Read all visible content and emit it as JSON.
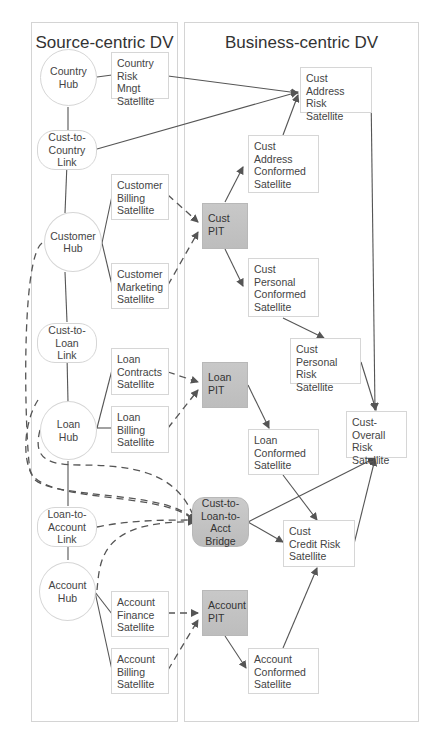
{
  "panels": {
    "left_title": "Source-centric DV",
    "right_title": "Business-centric DV"
  },
  "nodes": {
    "country_hub": "Country\nHub",
    "country_risk_sat": "Country\nRisk Mngt\nSatellite",
    "cust_country_link": "Cust-to-\nCountry\nLink",
    "customer_billing_sat": "Customer\nBilling\nSatellite",
    "customer_hub": "Customer\nHub",
    "customer_marketing_sat": "Customer\nMarketing\nSatellite",
    "cust_loan_link": "Cust-to-\nLoan\nLink",
    "loan_contracts_sat": "Loan\nContracts\nSatellite",
    "loan_hub": "Loan\nHub",
    "loan_billing_sat": "Loan\nBilling\nSatellite",
    "loan_account_link": "Loan-to-\nAccount\nLink",
    "account_hub": "Account\nHub",
    "account_finance_sat": "Account\nFinance\nSatellite",
    "account_billing_sat": "Account\nBilling\nSatellite",
    "cust_address_risk_sat": "Cust\nAddress Risk\nSatellite",
    "cust_address_conf_sat": "Cust\nAddress\nConformed\nSatellite",
    "cust_pit": "Cust\nPIT",
    "cust_personal_conf_sat": "Cust\nPersonal\nConformed\nSatellite",
    "cust_personal_risk_sat": "Cust\nPersonal Risk\nSatellite",
    "loan_pit": "Loan\nPIT",
    "cust_overall_risk_sat": "Cust-Overall\nRisk\nSatellite",
    "loan_conf_sat": "Loan\nConformed\nSatellite",
    "bridge": "Cust-to-\nLoan-to-\nAcct\nBridge",
    "cust_credit_risk_sat": "Cust\nCredit Risk\nSatellite",
    "account_pit": "Account\nPIT",
    "account_conf_sat": "Account\nConformed\nSatellite"
  },
  "colors": {
    "line": "#555555",
    "border": "#d6d6d6",
    "pit_fill": "#c4c4c4"
  }
}
